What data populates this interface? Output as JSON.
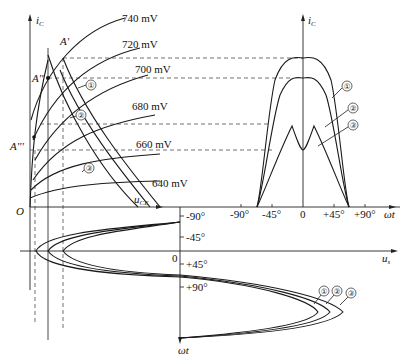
{
  "figure": {
    "output_chars": {
      "y_axis": "i",
      "y_axis_sub": "C",
      "x_axis": "u",
      "x_axis_sub": "CE",
      "origin": "O",
      "curves": [
        "740 mV",
        "720 mV",
        "700 mV",
        "680 mV",
        "660 mV",
        "640 mV"
      ],
      "points": [
        "A'",
        "A''",
        "A'''"
      ]
    },
    "waveform_ic": {
      "y_axis": "i",
      "y_axis_sub": "C",
      "x_axis": "ωt",
      "ticks": [
        "-90°",
        "-45°",
        "0",
        "+45°",
        "+90°"
      ]
    },
    "waveform_us": {
      "x_axis": "u",
      "x_axis_sub": "s",
      "y_axis": "ωt",
      "zero": "0",
      "ticks": [
        "-90°",
        "-45°",
        "+45°",
        "+90°"
      ]
    },
    "load_lines": [
      "①",
      "②",
      "③"
    ],
    "wave_labels": [
      "①",
      "②",
      "③"
    ],
    "us_labels": [
      "①",
      "②",
      "③"
    ]
  }
}
